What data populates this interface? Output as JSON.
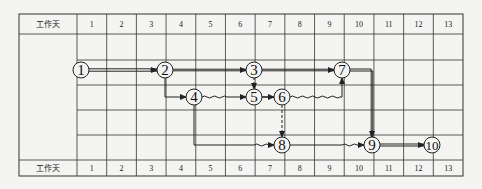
{
  "header": {
    "row_label": "工作天",
    "days": [
      "1",
      "2",
      "3",
      "4",
      "5",
      "6",
      "7",
      "8",
      "9",
      "10",
      "11",
      "12",
      "13"
    ]
  },
  "footer": {
    "row_label": "工作天",
    "days": [
      "1",
      "2",
      "3",
      "4",
      "5",
      "6",
      "7",
      "8",
      "9",
      "10",
      "11",
      "12",
      "13"
    ]
  },
  "nodes": [
    {
      "id": "1",
      "label": "1"
    },
    {
      "id": "2",
      "label": "2"
    },
    {
      "id": "3",
      "label": "3"
    },
    {
      "id": "4",
      "label": "4"
    },
    {
      "id": "5",
      "label": "5"
    },
    {
      "id": "6",
      "label": "6"
    },
    {
      "id": "7",
      "label": "7"
    },
    {
      "id": "8",
      "label": "8"
    },
    {
      "id": "9",
      "label": "9"
    },
    {
      "id": "10",
      "label": "10"
    }
  ],
  "edges": [
    {
      "from": "1",
      "to": "2",
      "style": "double-critical"
    },
    {
      "from": "2",
      "to": "3",
      "style": "solid"
    },
    {
      "from": "3",
      "to": "7",
      "style": "solid"
    },
    {
      "from": "2",
      "to": "4",
      "style": "solid"
    },
    {
      "from": "3",
      "to": "5",
      "style": "dashed"
    },
    {
      "from": "4",
      "to": "5",
      "style": "solid-with-wavy-free-float"
    },
    {
      "from": "5",
      "to": "6",
      "style": "solid"
    },
    {
      "from": "6",
      "to": "7",
      "style": "wavy-free-float"
    },
    {
      "from": "6",
      "to": "8",
      "style": "dashed"
    },
    {
      "from": "4",
      "to": "8",
      "style": "solid-with-wavy-free-float"
    },
    {
      "from": "7",
      "to": "9",
      "style": "double-critical"
    },
    {
      "from": "8",
      "to": "9",
      "style": "solid-with-wavy-free-float"
    },
    {
      "from": "9",
      "to": "10",
      "style": "double-critical"
    }
  ],
  "colors": {
    "line": "#222222",
    "grid": "#333333",
    "background": "#f4f4f2"
  }
}
